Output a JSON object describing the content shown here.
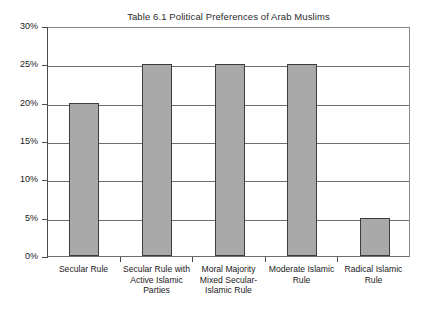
{
  "chart_data": {
    "type": "bar",
    "title": "Table 6.1  Political Preferences of Arab Muslims",
    "xlabel": "",
    "ylabel": "",
    "categories": [
      "Secular Rule",
      "Secular Rule with Active Islamic Parties",
      "Moral Majority Mixed Secular-Islamic Rule",
      "Moderate Islamic Rule",
      "Radical Islamic Rule"
    ],
    "category_lines": [
      [
        "Secular Rule"
      ],
      [
        "Secular Rule with",
        "Active Islamic",
        "Parties"
      ],
      [
        "Moral Majority",
        "Mixed Secular-",
        "Islamic Rule"
      ],
      [
        "Moderate Islamic",
        "Rule"
      ],
      [
        "Radical Islamic",
        "Rule"
      ]
    ],
    "values": [
      20,
      25,
      25,
      25,
      5
    ],
    "value_labels": [
      "20%",
      "25%",
      "25%",
      "25%",
      "5%"
    ],
    "ylim": [
      0,
      30
    ],
    "ytick_values": [
      0,
      5,
      10,
      15,
      20,
      25,
      30
    ],
    "ytick_labels": [
      "0%",
      "5%",
      "10%",
      "15%",
      "20%",
      "25%",
      "30%"
    ],
    "grid": true,
    "legend": "none",
    "bar_color": "#a9a9a9",
    "bar_border_color": "#3d3d3d",
    "axis_color": "#4a4a4a",
    "grid_color": "#6e6e6e",
    "background_color": "#ffffff"
  }
}
